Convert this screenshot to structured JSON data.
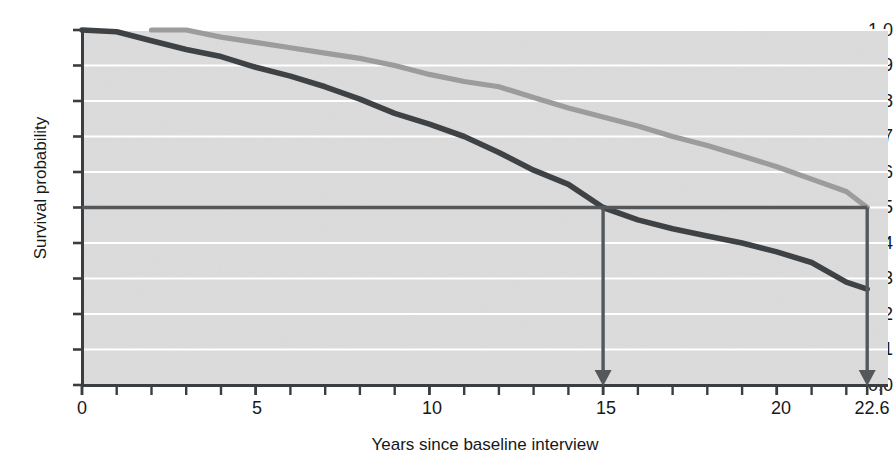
{
  "chart_data": {
    "type": "line",
    "title": "",
    "xlabel": "Years since baseline interview",
    "ylabel": "Survival probability",
    "xlim": [
      0,
      23.2
    ],
    "ylim": [
      0.0,
      1.0
    ],
    "grid": true,
    "grid_color": "#ffffff",
    "plot_background": "#dcdcdc",
    "legend_position": "inline-annotations",
    "x_tick_labels": [
      "0",
      "5",
      "10",
      "15",
      "20",
      "22.6"
    ],
    "x_tick_values": [
      0,
      5,
      10,
      15,
      20,
      22.6
    ],
    "x_minor_tick_step": 1,
    "y_tick_labels": [
      "1.0",
      "0.9",
      "0.8",
      "0.7",
      "0.6",
      "0.5",
      "0.4",
      "0.3",
      "0.2",
      "0.1",
      "0.0"
    ],
    "y_tick_values": [
      1.0,
      0.9,
      0.8,
      0.7,
      0.6,
      0.5,
      0.4,
      0.3,
      0.2,
      0.1,
      0.0
    ],
    "series": [
      {
        "name": "Positive attitudes",
        "color": "#9c9c9c",
        "label_text": "Positive attitudes",
        "x": [
          2.0,
          3.0,
          4.0,
          5.0,
          6.0,
          7.0,
          8.0,
          9.0,
          10.0,
          11.0,
          12.0,
          13.0,
          14.0,
          15.0,
          16.0,
          17.0,
          18.0,
          19.0,
          20.0,
          21.0,
          22.0,
          22.6
        ],
        "values": [
          1.0,
          1.0,
          0.98,
          0.965,
          0.95,
          0.935,
          0.92,
          0.9,
          0.875,
          0.855,
          0.84,
          0.81,
          0.78,
          0.755,
          0.73,
          0.7,
          0.675,
          0.645,
          0.615,
          0.58,
          0.545,
          0.5
        ]
      },
      {
        "name": "Negative attitudes",
        "color": "#3f4245",
        "label_text": "Negative attitudes",
        "x": [
          0.0,
          1.0,
          2.0,
          3.0,
          4.0,
          5.0,
          6.0,
          7.0,
          8.0,
          9.0,
          10.0,
          11.0,
          12.0,
          13.0,
          14.0,
          15.0,
          16.0,
          17.0,
          18.0,
          19.0,
          20.0,
          21.0,
          22.0,
          22.6
        ],
        "values": [
          1.0,
          0.995,
          0.97,
          0.945,
          0.925,
          0.895,
          0.87,
          0.84,
          0.805,
          0.765,
          0.735,
          0.7,
          0.655,
          0.605,
          0.565,
          0.5,
          0.465,
          0.44,
          0.42,
          0.4,
          0.375,
          0.345,
          0.29,
          0.27
        ]
      }
    ],
    "reference_line": {
      "name": "Average",
      "label_text": "Average",
      "y": 0.5,
      "color": "#55585b"
    },
    "annotations": [
      {
        "name": "average-negative-group",
        "text_line1": "Average for",
        "text_line2": "negative group",
        "arrow_x": 15,
        "arrow_from_y": 0.5,
        "arrow_to_y": 0.0,
        "color": "#55585b"
      },
      {
        "name": "average-positive-group",
        "text_line1": "Average for",
        "text_line2": "positive group",
        "arrow_x": 22.6,
        "arrow_from_y": 0.5,
        "arrow_to_y": 0.0,
        "color": "#55585b"
      }
    ]
  },
  "axis": {
    "line_color": "#3b3e41",
    "tick_color": "#3b3e41"
  }
}
